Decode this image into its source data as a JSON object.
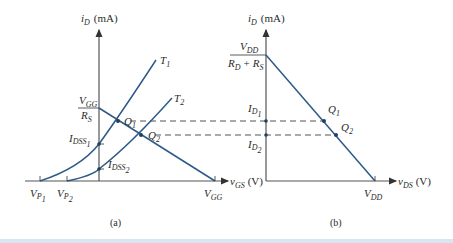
{
  "figure": {
    "panel_a": {
      "caption": "(a)",
      "y_axis_label": "i",
      "y_axis_label_sub": "D",
      "y_axis_unit": "(mA)",
      "x_axis_label": "v",
      "x_axis_label_sub": "GS",
      "x_axis_unit": "(V)",
      "curve_labels": [
        {
          "main": "T",
          "sub": "1"
        },
        {
          "main": "T",
          "sub": "2"
        }
      ],
      "intercept_label_top": {
        "main": "V",
        "sub": "GG"
      },
      "intercept_label_bottom": {
        "main": "R",
        "sub": "S"
      },
      "idss1": {
        "main": "I",
        "sub": "DSS",
        "subsub": "1"
      },
      "idss2": {
        "main": "I",
        "sub": "DSS",
        "subsub": "2"
      },
      "vp1": {
        "main": "V",
        "sub": "P",
        "subsub": "1"
      },
      "vp2": {
        "main": "V",
        "sub": "P",
        "subsub": "2"
      },
      "vgg": {
        "main": "V",
        "sub": "GG"
      },
      "q1": {
        "main": "Q",
        "sub": "1"
      },
      "q2": {
        "main": "Q",
        "sub": "2"
      }
    },
    "panel_b": {
      "caption": "(b)",
      "y_axis_label": "i",
      "y_axis_label_sub": "D",
      "y_axis_unit": "(mA)",
      "x_axis_label": "v",
      "x_axis_label_sub": "DS",
      "x_axis_unit": "(V)",
      "intercept_top": {
        "main": "V",
        "sub": "DD"
      },
      "intercept_bottom_1": {
        "main": "R",
        "sub": "D"
      },
      "intercept_plus": "+",
      "intercept_bottom_2": {
        "main": "R",
        "sub": "S"
      },
      "id1": {
        "main": "I",
        "sub": "D",
        "subsub": "1"
      },
      "id2": {
        "main": "I",
        "sub": "D",
        "subsub": "2"
      },
      "vdd": {
        "main": "V",
        "sub": "DD"
      },
      "q1": {
        "main": "Q",
        "sub": "1"
      },
      "q2": {
        "main": "Q",
        "sub": "2"
      }
    }
  },
  "colors": {
    "curve": "#2d5a87",
    "axis": "#555555",
    "point": "#1f3f66"
  }
}
